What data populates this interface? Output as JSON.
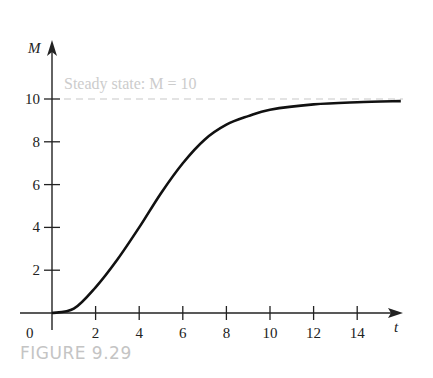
{
  "caption": "FIGURE 9.29",
  "chart_data": {
    "type": "line",
    "title": "",
    "xlabel": "t",
    "ylabel": "M",
    "xlim": [
      0,
      16
    ],
    "ylim": [
      0,
      11
    ],
    "x_ticks": [
      2,
      4,
      6,
      8,
      10,
      12,
      14
    ],
    "y_ticks": [
      2,
      4,
      6,
      8,
      10
    ],
    "origin_label": "0",
    "grid": false,
    "annotations": [
      {
        "text": "Steady state: M = 10",
        "y": 10,
        "style": "dashed horizontal line"
      }
    ],
    "series": [
      {
        "name": "M(t)",
        "x": [
          0,
          1,
          2,
          3,
          4,
          5,
          6,
          7,
          8,
          9,
          10,
          12,
          14,
          16
        ],
        "values": [
          0,
          0.2,
          1.2,
          2.5,
          4.0,
          5.6,
          7.0,
          8.1,
          8.8,
          9.2,
          9.5,
          9.75,
          9.85,
          9.9
        ]
      }
    ]
  }
}
